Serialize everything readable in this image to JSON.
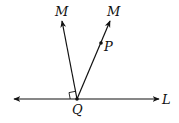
{
  "diagram": {
    "labels": {
      "ray_left": "M",
      "ray_right": "M",
      "point_p": "P",
      "vertex": "Q",
      "line": "L"
    },
    "annotations": {
      "right_angle_marker": "right angle between ray QM (left) and line L"
    },
    "colors": {
      "stroke": "#111111",
      "background": "#ffffff"
    }
  }
}
